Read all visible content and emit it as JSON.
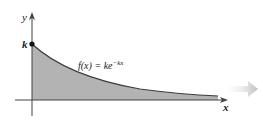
{
  "diagram": {
    "function_label": "f(x) = ke",
    "function_exponent": "−kx",
    "x_axis_label": "x",
    "y_axis_label": "y",
    "intercept_label": "k",
    "colors": {
      "fill": "#b3b3b3",
      "curve": "#3a3a3a",
      "axis": "#444444",
      "arrow_hint": "#c8c8c8"
    }
  }
}
